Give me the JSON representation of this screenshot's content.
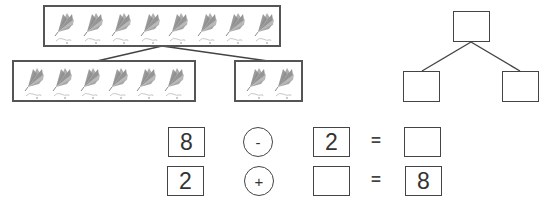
{
  "picture_bond": {
    "whole": {
      "count": 8,
      "icon": "fan-kite-icon"
    },
    "parts": [
      {
        "count": 6,
        "icon": "fan-kite-icon"
      },
      {
        "count": 2,
        "icon": "fan-kite-icon"
      }
    ]
  },
  "number_bond": {
    "whole": "",
    "part_left": "",
    "part_right": ""
  },
  "equations": [
    {
      "a": "8",
      "op": "-",
      "b": "2",
      "eq": "=",
      "result": ""
    },
    {
      "a": "2",
      "op": "+",
      "b": "",
      "eq": "=",
      "result": "8"
    }
  ],
  "colors": {
    "border": "#555555",
    "icon_gray": "#8a8a8a",
    "icon_light": "#c8c8c8"
  }
}
